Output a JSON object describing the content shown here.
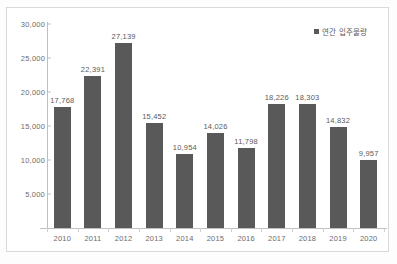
{
  "chart_data": {
    "type": "bar",
    "title": "",
    "subtitle": "",
    "xlabel": "",
    "ylabel": "",
    "categories": [
      "2010",
      "2011",
      "2012",
      "2013",
      "2014",
      "2015",
      "2016",
      "2017",
      "2018",
      "2019",
      "2020"
    ],
    "values": [
      17768,
      22391,
      27139,
      15452,
      10954,
      14026,
      11798,
      18226,
      18303,
      14832,
      9957
    ],
    "data_labels": [
      "17,768",
      "22,391",
      "27,139",
      "15,452",
      "10,954",
      "14,026",
      "11,798",
      "18,226",
      "18,303",
      "14,832",
      "9,957"
    ],
    "series": [
      {
        "name": "연간 입주물량",
        "color": "#595959",
        "values": [
          17768,
          22391,
          27139,
          15452,
          10954,
          14026,
          11798,
          18226,
          18303,
          14832,
          9957
        ]
      }
    ],
    "ylim": [
      0,
      30000
    ],
    "ytick_values": [
      30000,
      25000,
      20000,
      15000,
      10000,
      5000
    ],
    "ytick_labels": [
      "30,000",
      "25,000",
      "20,000",
      "15,000",
      "10,000",
      "5,000"
    ],
    "grid": false,
    "legend_position": "top-right",
    "legend_entries": [
      "연간 입주물량"
    ],
    "annotations": []
  },
  "legend": {
    "label": "연간 입주물량"
  },
  "colors": {
    "bar": "#595959",
    "axis": "#bfbfbf",
    "text": "#6b6b6b",
    "frame": "#d9d9d9",
    "background": "#ffffff"
  }
}
